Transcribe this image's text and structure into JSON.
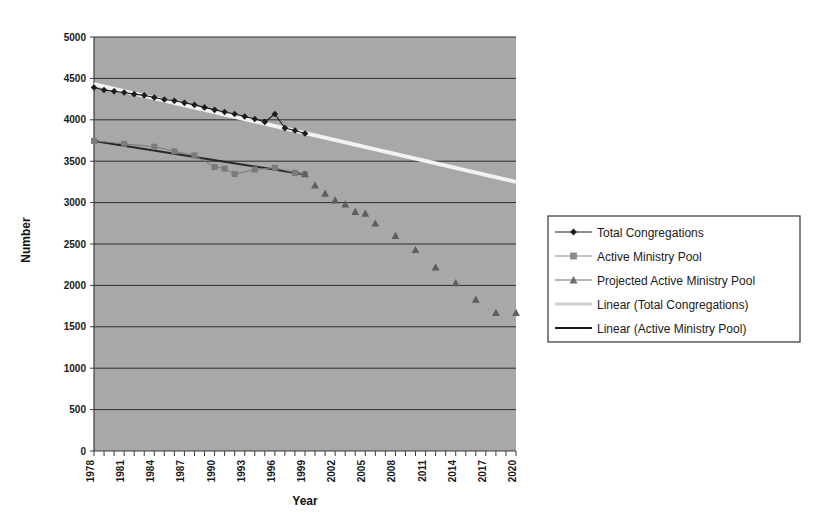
{
  "chart_data": {
    "type": "line",
    "title": "",
    "xlabel": "Year",
    "ylabel": "Number",
    "xlim": [
      1978,
      2020
    ],
    "ylim": [
      0,
      5000
    ],
    "ytick_step": 500,
    "yticks": [
      "0",
      "500",
      "1000",
      "1500",
      "2000",
      "2500",
      "3000",
      "3500",
      "4000",
      "4500",
      "5000"
    ],
    "xticks": [
      "1978",
      "1981",
      "1984",
      "1987",
      "1990",
      "1993",
      "1996",
      "1999",
      "2002",
      "2005",
      "2008",
      "2011",
      "2014",
      "2017",
      "2020"
    ],
    "xtick_step": 3,
    "grid": "horizontal",
    "plot_background": "#a8a8a8",
    "legend_position": "right",
    "series": [
      {
        "name": "Total Congregations",
        "marker": "diamond",
        "color": "#1c1c1c",
        "x": [
          1978,
          1979,
          1980,
          1981,
          1982,
          1983,
          1984,
          1985,
          1986,
          1987,
          1988,
          1989,
          1990,
          1991,
          1992,
          1993,
          1994,
          1995,
          1996,
          1997,
          1998,
          1999
        ],
        "values": [
          4390,
          4360,
          4345,
          4330,
          4310,
          4295,
          4270,
          4245,
          4230,
          4205,
          4180,
          4150,
          4120,
          4095,
          4070,
          4040,
          4010,
          3975,
          4070,
          3900,
          3870,
          3835
        ]
      },
      {
        "name": "Active Ministry Pool",
        "marker": "square",
        "color": "#7a7a7a",
        "x": [
          1978,
          1981,
          1984,
          1986,
          1988,
          1990,
          1991,
          1992,
          1994,
          1996,
          1998,
          1999
        ],
        "values": [
          3745,
          3710,
          3675,
          3620,
          3570,
          3430,
          3410,
          3345,
          3400,
          3420,
          3360,
          3345
        ]
      },
      {
        "name": "Projected Active Ministry Pool",
        "marker": "triangle",
        "color": "#5e5e5e",
        "x": [
          1999,
          2000,
          2001,
          2002,
          2003,
          2004,
          2005,
          2006,
          2008,
          2010,
          2012,
          2014,
          2016,
          2018,
          2020
        ],
        "values": [
          3345,
          3210,
          3110,
          3030,
          2980,
          2890,
          2870,
          2750,
          2600,
          2430,
          2220,
          2030,
          1830,
          1670,
          1670
        ]
      }
    ],
    "trendlines": [
      {
        "name": "Linear (Total Congregations)",
        "color": "#f2f2f2",
        "x_start": 1978,
        "y_start": 4430,
        "x_end": 2020,
        "y_end": 3250,
        "width": 4
      },
      {
        "name": "Linear (Active Ministry Pool)",
        "color": "#262626",
        "x_start": 1978,
        "y_start": 3745,
        "x_end": 1999,
        "y_end": 3340,
        "width": 2
      }
    ],
    "legend": [
      {
        "label": "Total Congregations",
        "marker": "diamond",
        "line_color": "#1c1c1c",
        "marker_color": "#1c1c1c"
      },
      {
        "label": "Active Ministry Pool",
        "marker": "square",
        "line_color": "#8a8a8a",
        "marker_color": "#8a8a8a"
      },
      {
        "label": "Projected Active Ministry Pool",
        "marker": "triangle",
        "line_color": "#6e6e6e",
        "marker_color": "#6e6e6e"
      },
      {
        "label": "Linear (Total Congregations)",
        "marker": "none",
        "line_color": "#cfcfcf",
        "marker_color": "#cfcfcf"
      },
      {
        "label": "Linear (Active Ministry Pool)",
        "marker": "none",
        "line_color": "#1a1a1a",
        "marker_color": "#1a1a1a"
      }
    ]
  }
}
